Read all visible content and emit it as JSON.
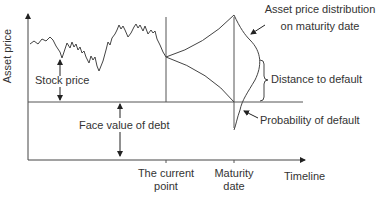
{
  "diagram": {
    "y_axis_label": "Asset price",
    "x_axis_label": "Timeline",
    "labels": {
      "stock_price": "Stock price",
      "face_value_of_debt": "Face value of debt",
      "asset_price_distribution_line1": "Asset price distribution",
      "asset_price_distribution_line2": "on maturity date",
      "distance_to_default": "Distance to default",
      "probability_of_default": "Probability of default",
      "current_point_line1": "The current",
      "current_point_line2": "point",
      "maturity_date_line1": "Maturity",
      "maturity_date_line2": "date"
    },
    "colors": {
      "line": "#444444",
      "text": "#333333"
    }
  }
}
